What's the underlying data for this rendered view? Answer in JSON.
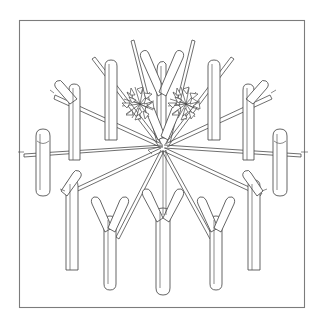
{
  "figure": {
    "title": "Radial arrangement of cut twigs and branch forks",
    "caption": "",
    "frame": {
      "present": true,
      "stroke_color": "#7c7c7c",
      "fill_color": "#ffffff",
      "x": 19,
      "y": 20,
      "width": 286,
      "height": 288
    },
    "canvas": {
      "width": 322,
      "height": 326,
      "background_color": "#ffffff"
    },
    "style": {
      "line_color": "#4a4a4a",
      "fill_color": "#ffffff",
      "technique": "pen-and-ink contour line drawing",
      "shading": "none"
    },
    "center_point": {
      "x": 163,
      "y": 145
    },
    "elements": {
      "spoke_count": 12,
      "leaf_cluster_count": 2,
      "fork_twig_count": 6,
      "plain_twig_count": 10,
      "labels": []
    },
    "chart_data": {
      "type": "scatter",
      "title": "Radial arrangement of cut twigs and branch forks",
      "xlabel": "",
      "ylabel": "",
      "xlim": [
        19,
        305
      ],
      "ylim": [
        20,
        308
      ],
      "grid": false,
      "legend": "none",
      "center": [
        163,
        145
      ],
      "spokes": [
        {
          "name": "spoke-W",
          "angle_deg": 180,
          "x2": 24,
          "y2": 155
        },
        {
          "name": "spoke-WNW",
          "angle_deg": 168,
          "x2": 56,
          "y2": 98
        },
        {
          "name": "spoke-NW",
          "angle_deg": 140,
          "x2": 96,
          "y2": 60
        },
        {
          "name": "spoke-NNW",
          "angle_deg": 110,
          "x2": 136,
          "y2": 42
        },
        {
          "name": "spoke-NNE",
          "angle_deg": 70,
          "x2": 190,
          "y2": 42
        },
        {
          "name": "spoke-NE",
          "angle_deg": 40,
          "x2": 230,
          "y2": 60
        },
        {
          "name": "spoke-ENE",
          "angle_deg": 12,
          "x2": 268,
          "y2": 98
        },
        {
          "name": "spoke-E",
          "angle_deg": 0,
          "x2": 300,
          "y2": 155
        },
        {
          "name": "spoke-ESE",
          "angle_deg": -22,
          "x2": 262,
          "y2": 196
        },
        {
          "name": "spoke-SE",
          "angle_deg": -55,
          "x2": 212,
          "y2": 240
        },
        {
          "name": "spoke-SSW",
          "angle_deg": -125,
          "x2": 116,
          "y2": 240
        },
        {
          "name": "spoke-WSW",
          "angle_deg": -158,
          "x2": 66,
          "y2": 196
        }
      ],
      "twigs": [
        {
          "name": "twig-top-center-fork",
          "cx": 163,
          "cy": 78,
          "kind": "fork"
        },
        {
          "name": "twig-top-left",
          "cx": 112,
          "cy": 88,
          "kind": "plain"
        },
        {
          "name": "twig-top-right",
          "cx": 214,
          "cy": 88,
          "kind": "plain"
        },
        {
          "name": "twig-upper-left-fork",
          "cx": 78,
          "cy": 104,
          "kind": "fork"
        },
        {
          "name": "twig-upper-right-fork",
          "cx": 248,
          "cy": 104,
          "kind": "fork"
        },
        {
          "name": "twig-mid-left",
          "cx": 44,
          "cy": 160,
          "kind": "plain"
        },
        {
          "name": "twig-mid-right",
          "cx": 282,
          "cy": 160,
          "kind": "plain"
        },
        {
          "name": "twig-lower-left-fork",
          "cx": 72,
          "cy": 212,
          "kind": "fork"
        },
        {
          "name": "twig-lower-right-fork",
          "cx": 254,
          "cy": 212,
          "kind": "fork"
        },
        {
          "name": "twig-bottom-left-fork",
          "cx": 112,
          "cy": 244,
          "kind": "fork"
        },
        {
          "name": "twig-bottom-center",
          "cx": 163,
          "cy": 244,
          "kind": "fork"
        },
        {
          "name": "twig-bottom-right-fork",
          "cx": 214,
          "cy": 244,
          "kind": "fork"
        }
      ],
      "leaf_clusters": [
        {
          "name": "leaf-cluster-left",
          "cx": 140,
          "cy": 104,
          "spike_count": 14
        },
        {
          "name": "leaf-cluster-right",
          "cx": 186,
          "cy": 104,
          "spike_count": 14
        }
      ]
    }
  }
}
